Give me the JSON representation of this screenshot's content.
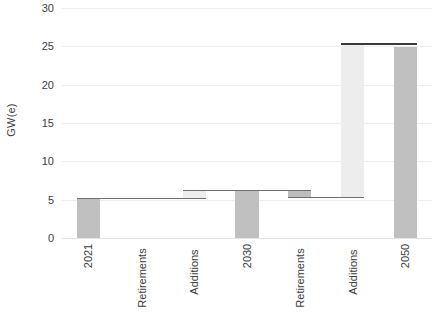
{
  "chart_data": {
    "type": "bar",
    "subtype": "waterfall",
    "title": "",
    "xlabel": "",
    "ylabel": "GW(e)",
    "ylim": [
      0,
      30
    ],
    "ytick_labels": [
      "30",
      "25",
      "20",
      "15",
      "10",
      "5",
      "0"
    ],
    "ytick_values": [
      30,
      25,
      20,
      15,
      10,
      5,
      0
    ],
    "grid": true,
    "legend": "none",
    "categories": [
      "2021",
      "Retirements",
      "Additions",
      "2030",
      "Retirements",
      "Additions",
      "2050"
    ],
    "bars": [
      {
        "label": "2021",
        "kind": "total",
        "base": 0.0,
        "top": 5.2,
        "value": 5.2,
        "color": "#c0c0c0"
      },
      {
        "label": "Retirements",
        "kind": "decrease",
        "base": 5.2,
        "top": 5.2,
        "value": 0.0,
        "color": "#bdbdbd"
      },
      {
        "label": "Additions",
        "kind": "increase",
        "base": 5.2,
        "top": 6.3,
        "value": 1.1,
        "color": "#ededed"
      },
      {
        "label": "2030",
        "kind": "total",
        "base": 0.0,
        "top": 6.3,
        "value": 6.3,
        "color": "#c0c0c0"
      },
      {
        "label": "Retirements",
        "kind": "decrease",
        "base": 5.4,
        "top": 6.3,
        "value": -0.9,
        "color": "#bdbdbd"
      },
      {
        "label": "Additions",
        "kind": "increase",
        "base": 5.4,
        "top": 25.4,
        "value": 20.0,
        "color": "#ededed"
      },
      {
        "label": "2050",
        "kind": "total",
        "base": 0.0,
        "top": 24.9,
        "value": 24.9,
        "color": "#c0c0c0"
      }
    ],
    "connectors": [
      {
        "from_bar": 0,
        "to_bar": 1,
        "level": 5.2,
        "weight": "normal"
      },
      {
        "from_bar": 1,
        "to_bar": 2,
        "level": 5.2,
        "weight": "normal"
      },
      {
        "from_bar": 2,
        "to_bar": 3,
        "level": 6.3,
        "weight": "normal"
      },
      {
        "from_bar": 3,
        "to_bar": 4,
        "level": 6.3,
        "weight": "normal"
      },
      {
        "from_bar": 4,
        "to_bar": 5,
        "level": 5.4,
        "weight": "normal"
      },
      {
        "from_bar": 5,
        "to_bar": 6,
        "level": 25.4,
        "weight": "thick"
      }
    ],
    "colors": {
      "total_bar": "#c0c0c0",
      "decrease_bar": "#bdbdbd",
      "increase_bar": "#ededed",
      "connector": "#6e6e6e",
      "connector_thick": "#3a3a3a",
      "gridline": "#eaeef0",
      "text": "#3c3c3c",
      "background": "#ffffff"
    }
  }
}
